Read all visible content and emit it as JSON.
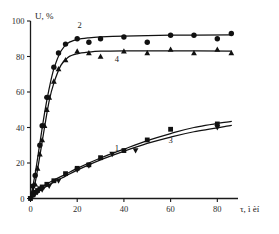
{
  "chart_data": {
    "type": "line",
    "title": "",
    "xlabel": "τ, ì èí",
    "ylabel": "U, %",
    "xlim": [
      0,
      88
    ],
    "ylim": [
      0,
      100
    ],
    "xticks": [
      0,
      20,
      40,
      60,
      80
    ],
    "yticks": [
      0,
      20,
      40,
      60,
      80,
      100
    ],
    "grid": false,
    "legend": "inline-curve-labels",
    "series": [
      {
        "name": "1",
        "label": "1",
        "marker": "square",
        "color": "#111111",
        "label_x": 37,
        "label_y": 27,
        "points": [
          {
            "x": 0,
            "y": 0
          },
          {
            "x": 1,
            "y": 2
          },
          {
            "x": 2,
            "y": 3.5
          },
          {
            "x": 3,
            "y": 4.5
          },
          {
            "x": 4,
            "y": 5.5
          },
          {
            "x": 5,
            "y": 6.5
          },
          {
            "x": 7,
            "y": 8
          },
          {
            "x": 10,
            "y": 10
          },
          {
            "x": 15,
            "y": 14
          },
          {
            "x": 20,
            "y": 17
          },
          {
            "x": 25,
            "y": 19
          },
          {
            "x": 30,
            "y": 23
          },
          {
            "x": 40,
            "y": 27
          },
          {
            "x": 50,
            "y": 33
          },
          {
            "x": 60,
            "y": 39
          },
          {
            "x": 80,
            "y": 42
          }
        ],
        "curve": [
          {
            "x": 0,
            "y": 0
          },
          {
            "x": 2,
            "y": 3.6
          },
          {
            "x": 5,
            "y": 6.6
          },
          {
            "x": 10,
            "y": 10.4
          },
          {
            "x": 15,
            "y": 13.6
          },
          {
            "x": 20,
            "y": 17.0
          },
          {
            "x": 30,
            "y": 22.8
          },
          {
            "x": 40,
            "y": 27.8
          },
          {
            "x": 50,
            "y": 32.6
          },
          {
            "x": 60,
            "y": 36.6
          },
          {
            "x": 70,
            "y": 40.0
          },
          {
            "x": 86,
            "y": 43.5
          }
        ]
      },
      {
        "name": "3",
        "label": "3",
        "marker": "triangle-down",
        "color": "#111111",
        "label_x": 60,
        "label_y": 31,
        "points": [
          {
            "x": 0,
            "y": 0
          },
          {
            "x": 1,
            "y": 1.5
          },
          {
            "x": 2,
            "y": 2.5
          },
          {
            "x": 3,
            "y": 3.5
          },
          {
            "x": 5,
            "y": 5
          },
          {
            "x": 8,
            "y": 7
          },
          {
            "x": 12,
            "y": 10
          },
          {
            "x": 20,
            "y": 16
          },
          {
            "x": 25,
            "y": 18.5
          },
          {
            "x": 35,
            "y": 25
          },
          {
            "x": 45,
            "y": 27
          },
          {
            "x": 80,
            "y": 40
          }
        ],
        "curve": [
          {
            "x": 0,
            "y": 0
          },
          {
            "x": 2,
            "y": 2.8
          },
          {
            "x": 5,
            "y": 5.4
          },
          {
            "x": 10,
            "y": 9.2
          },
          {
            "x": 15,
            "y": 12.6
          },
          {
            "x": 20,
            "y": 16.0
          },
          {
            "x": 30,
            "y": 21.8
          },
          {
            "x": 40,
            "y": 26.6
          },
          {
            "x": 50,
            "y": 31.0
          },
          {
            "x": 60,
            "y": 34.6
          },
          {
            "x": 70,
            "y": 37.6
          },
          {
            "x": 86,
            "y": 41.2
          }
        ]
      },
      {
        "name": "2",
        "label": "2",
        "marker": "circle",
        "color": "#111111",
        "label_x": 21,
        "label_y": 96,
        "points": [
          {
            "x": 1,
            "y": 7
          },
          {
            "x": 2,
            "y": 13
          },
          {
            "x": 4,
            "y": 30
          },
          {
            "x": 5,
            "y": 41
          },
          {
            "x": 7,
            "y": 57
          },
          {
            "x": 10,
            "y": 74
          },
          {
            "x": 12,
            "y": 82
          },
          {
            "x": 15,
            "y": 87
          },
          {
            "x": 20,
            "y": 90
          },
          {
            "x": 25,
            "y": 88
          },
          {
            "x": 30,
            "y": 90
          },
          {
            "x": 40,
            "y": 91
          },
          {
            "x": 50,
            "y": 88
          },
          {
            "x": 60,
            "y": 92
          },
          {
            "x": 70,
            "y": 92
          },
          {
            "x": 80,
            "y": 90
          },
          {
            "x": 86,
            "y": 93
          }
        ],
        "curve": [
          {
            "x": 0,
            "y": 0
          },
          {
            "x": 2,
            "y": 14
          },
          {
            "x": 4,
            "y": 31
          },
          {
            "x": 6,
            "y": 48
          },
          {
            "x": 8,
            "y": 62
          },
          {
            "x": 10,
            "y": 73
          },
          {
            "x": 13,
            "y": 83
          },
          {
            "x": 16,
            "y": 87.5
          },
          {
            "x": 20,
            "y": 89.5
          },
          {
            "x": 25,
            "y": 90.5
          },
          {
            "x": 30,
            "y": 91
          },
          {
            "x": 40,
            "y": 91.5
          },
          {
            "x": 60,
            "y": 92
          },
          {
            "x": 86,
            "y": 92.2
          }
        ]
      },
      {
        "name": "4",
        "label": "4",
        "marker": "triangle-up",
        "color": "#111111",
        "label_x": 37,
        "label_y": 77,
        "points": [
          {
            "x": 1,
            "y": 4
          },
          {
            "x": 2,
            "y": 8
          },
          {
            "x": 3,
            "y": 17
          },
          {
            "x": 4,
            "y": 25
          },
          {
            "x": 5,
            "y": 33
          },
          {
            "x": 6,
            "y": 41
          },
          {
            "x": 7,
            "y": 50
          },
          {
            "x": 8,
            "y": 57
          },
          {
            "x": 10,
            "y": 66
          },
          {
            "x": 12,
            "y": 73
          },
          {
            "x": 15,
            "y": 78
          },
          {
            "x": 20,
            "y": 83
          },
          {
            "x": 25,
            "y": 82
          },
          {
            "x": 30,
            "y": 80
          },
          {
            "x": 40,
            "y": 83
          },
          {
            "x": 50,
            "y": 82
          },
          {
            "x": 60,
            "y": 84
          },
          {
            "x": 70,
            "y": 82
          },
          {
            "x": 80,
            "y": 84
          },
          {
            "x": 86,
            "y": 82
          }
        ],
        "curve": [
          {
            "x": 0,
            "y": 0
          },
          {
            "x": 2,
            "y": 9
          },
          {
            "x": 4,
            "y": 24
          },
          {
            "x": 6,
            "y": 40
          },
          {
            "x": 8,
            "y": 55
          },
          {
            "x": 10,
            "y": 65
          },
          {
            "x": 13,
            "y": 75
          },
          {
            "x": 16,
            "y": 79.5
          },
          {
            "x": 20,
            "y": 81.5
          },
          {
            "x": 25,
            "y": 82.5
          },
          {
            "x": 30,
            "y": 83
          },
          {
            "x": 40,
            "y": 83.2
          },
          {
            "x": 60,
            "y": 83.2
          },
          {
            "x": 86,
            "y": 83
          }
        ]
      }
    ]
  }
}
